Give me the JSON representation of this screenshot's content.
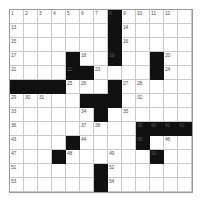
{
  "puzzle": {
    "title": "Crossword Grid",
    "columns": 13,
    "rows": 13,
    "cell_size_px": 14,
    "colors": {
      "block": "#111111",
      "grid_line": "#c9c9c9",
      "border": "#9a9a9a",
      "number_text": "#555555",
      "background": "#ffffff"
    },
    "blocks": [
      [
        1,
        8
      ],
      [
        2,
        8
      ],
      [
        3,
        8
      ],
      [
        4,
        5
      ],
      [
        4,
        8
      ],
      [
        4,
        11
      ],
      [
        5,
        5
      ],
      [
        5,
        6
      ],
      [
        5,
        11
      ],
      [
        6,
        1
      ],
      [
        6,
        2
      ],
      [
        6,
        3
      ],
      [
        6,
        4
      ],
      [
        6,
        8
      ],
      [
        7,
        6
      ],
      [
        7,
        7
      ],
      [
        7,
        8
      ],
      [
        8,
        7
      ],
      [
        9,
        10
      ],
      [
        9,
        11
      ],
      [
        9,
        12
      ],
      [
        9,
        13
      ],
      [
        10,
        5
      ],
      [
        10,
        10
      ],
      [
        11,
        4
      ],
      [
        11,
        11
      ],
      [
        12,
        7
      ],
      [
        13,
        7
      ]
    ],
    "numbers": [
      {
        "row": 1,
        "col": 1,
        "n": "1"
      },
      {
        "row": 1,
        "col": 2,
        "n": "2"
      },
      {
        "row": 1,
        "col": 3,
        "n": "3"
      },
      {
        "row": 1,
        "col": 4,
        "n": "4"
      },
      {
        "row": 1,
        "col": 5,
        "n": "5"
      },
      {
        "row": 1,
        "col": 6,
        "n": "6"
      },
      {
        "row": 1,
        "col": 7,
        "n": "7"
      },
      {
        "row": 1,
        "col": 8,
        "n": "8"
      },
      {
        "row": 1,
        "col": 9,
        "n": "9"
      },
      {
        "row": 1,
        "col": 10,
        "n": "10"
      },
      {
        "row": 1,
        "col": 11,
        "n": "11"
      },
      {
        "row": 1,
        "col": 12,
        "n": "12"
      },
      {
        "row": 2,
        "col": 1,
        "n": "13"
      },
      {
        "row": 2,
        "col": 9,
        "n": "14"
      },
      {
        "row": 3,
        "col": 1,
        "n": "15"
      },
      {
        "row": 3,
        "col": 9,
        "n": "16"
      },
      {
        "row": 4,
        "col": 1,
        "n": "17"
      },
      {
        "row": 4,
        "col": 6,
        "n": "18"
      },
      {
        "row": 4,
        "col": 8,
        "n": "19"
      },
      {
        "row": 4,
        "col": 12,
        "n": "20"
      },
      {
        "row": 5,
        "col": 1,
        "n": "21"
      },
      {
        "row": 5,
        "col": 5,
        "n": "22"
      },
      {
        "row": 5,
        "col": 7,
        "n": "23"
      },
      {
        "row": 5,
        "col": 12,
        "n": "24"
      },
      {
        "row": 6,
        "col": 5,
        "n": "25"
      },
      {
        "row": 6,
        "col": 6,
        "n": "26"
      },
      {
        "row": 6,
        "col": 9,
        "n": "27"
      },
      {
        "row": 6,
        "col": 10,
        "n": "28"
      },
      {
        "row": 7,
        "col": 1,
        "n": "29"
      },
      {
        "row": 7,
        "col": 2,
        "n": "30"
      },
      {
        "row": 7,
        "col": 3,
        "n": "31"
      },
      {
        "row": 7,
        "col": 10,
        "n": "32"
      },
      {
        "row": 8,
        "col": 1,
        "n": "33"
      },
      {
        "row": 8,
        "col": 6,
        "n": "34"
      },
      {
        "row": 8,
        "col": 9,
        "n": "35"
      },
      {
        "row": 9,
        "col": 1,
        "n": "36"
      },
      {
        "row": 9,
        "col": 6,
        "n": "37"
      },
      {
        "row": 9,
        "col": 7,
        "n": "38"
      },
      {
        "row": 9,
        "col": 10,
        "n": "39"
      },
      {
        "row": 9,
        "col": 11,
        "n": "40"
      },
      {
        "row": 9,
        "col": 12,
        "n": "41"
      },
      {
        "row": 9,
        "col": 13,
        "n": "42"
      },
      {
        "row": 10,
        "col": 1,
        "n": "43"
      },
      {
        "row": 10,
        "col": 6,
        "n": "44"
      },
      {
        "row": 10,
        "col": 10,
        "n": "45"
      },
      {
        "row": 10,
        "col": 12,
        "n": "46"
      },
      {
        "row": 11,
        "col": 1,
        "n": "47"
      },
      {
        "row": 11,
        "col": 5,
        "n": "48"
      },
      {
        "row": 11,
        "col": 8,
        "n": "49"
      },
      {
        "row": 11,
        "col": 11,
        "n": "50"
      },
      {
        "row": 12,
        "col": 1,
        "n": "51"
      },
      {
        "row": 12,
        "col": 8,
        "n": "52"
      },
      {
        "row": 13,
        "col": 1,
        "n": "53"
      },
      {
        "row": 13,
        "col": 8,
        "n": "54"
      }
    ]
  }
}
